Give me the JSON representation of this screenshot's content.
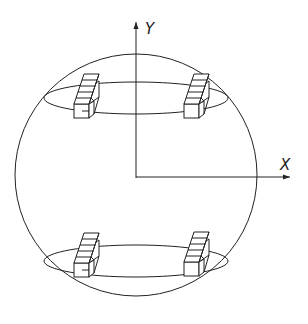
{
  "diagram": {
    "axes": {
      "y_label": "Y",
      "x_label": "X"
    },
    "sphere": {
      "cx": 136,
      "cy": 170,
      "r": 121
    },
    "rings": [
      {
        "name": "upper-ring",
        "cx": 136,
        "cy": 98,
        "rx": 92,
        "ry": 16
      },
      {
        "name": "lower-ring",
        "cx": 136,
        "cy": 262,
        "rx": 92,
        "ry": 16
      }
    ],
    "blocks": [
      {
        "name": "block-upper-left",
        "x": 74,
        "y": 95
      },
      {
        "name": "block-upper-right",
        "x": 184,
        "y": 95
      },
      {
        "name": "block-lower-left",
        "x": 74,
        "y": 254
      },
      {
        "name": "block-lower-right",
        "x": 184,
        "y": 253
      }
    ]
  }
}
